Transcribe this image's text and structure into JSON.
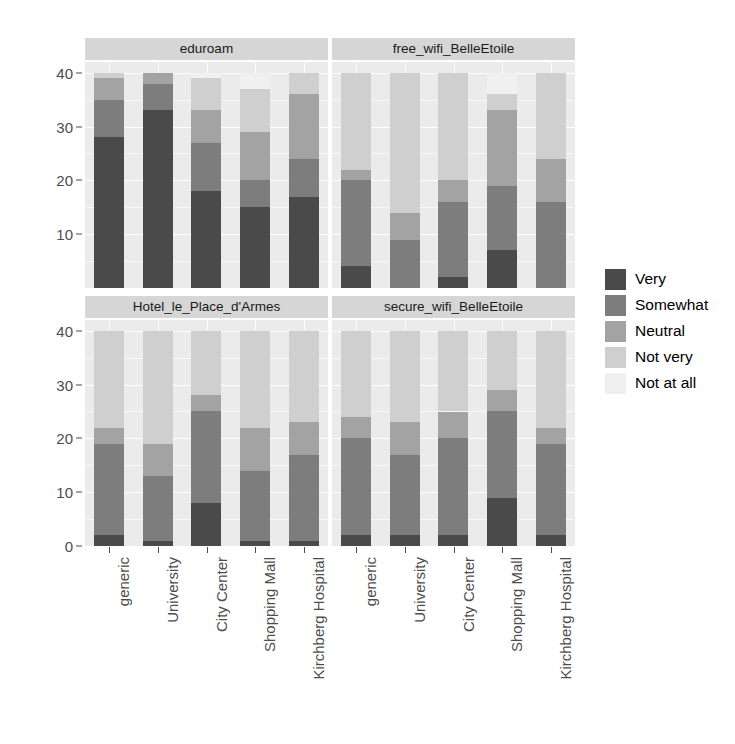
{
  "chart_data": {
    "type": "bar",
    "subtype": "stacked-bar-faceted",
    "title": "",
    "xlabel": "",
    "ylabel": "Count",
    "ylim": [
      0,
      42
    ],
    "y_ticks": [
      0,
      10,
      20,
      30,
      40
    ],
    "y_minor_ticks": [
      5,
      15,
      25,
      35
    ],
    "grid": true,
    "legend_position": "right",
    "legend_title": "",
    "categories": [
      "generic",
      "University",
      "City Center",
      "Shopping Mall",
      "Kirchberg Hospital"
    ],
    "series_order": [
      "Very",
      "Somewhat",
      "Neutral",
      "Not very",
      "Not at all"
    ],
    "series_colors": {
      "Very": "#4a4a4a",
      "Somewhat": "#7d7d7d",
      "Neutral": "#a3a3a3",
      "Not very": "#cfcfcf",
      "Not at all": "#f0f0f0"
    },
    "facets": [
      {
        "name": "eduroam",
        "position": "top-left",
        "bars": [
          {
            "category": "generic",
            "values": {
              "Very": 28,
              "Somewhat": 7,
              "Neutral": 4,
              "Not very": 1,
              "Not at all": 0
            },
            "total": 40
          },
          {
            "category": "University",
            "values": {
              "Very": 33,
              "Somewhat": 5,
              "Neutral": 2,
              "Not very": 0,
              "Not at all": 0
            },
            "total": 40
          },
          {
            "category": "City Center",
            "values": {
              "Very": 18,
              "Somewhat": 9,
              "Neutral": 6,
              "Not very": 6,
              "Not at all": 1
            },
            "total": 40
          },
          {
            "category": "Shopping Mall",
            "values": {
              "Very": 15,
              "Somewhat": 5,
              "Neutral": 9,
              "Not very": 8,
              "Not at all": 3
            },
            "total": 40
          },
          {
            "category": "Kirchberg Hospital",
            "values": {
              "Very": 17,
              "Somewhat": 7,
              "Neutral": 12,
              "Not very": 4,
              "Not at all": 0
            },
            "total": 40
          }
        ]
      },
      {
        "name": "free_wifi_BelleEtoile",
        "position": "top-right",
        "bars": [
          {
            "category": "generic",
            "values": {
              "Very": 4,
              "Somewhat": 16,
              "Neutral": 2,
              "Not very": 18,
              "Not at all": 0
            },
            "total": 40
          },
          {
            "category": "University",
            "values": {
              "Very": 0,
              "Somewhat": 9,
              "Neutral": 5,
              "Not very": 26,
              "Not at all": 0
            },
            "total": 40
          },
          {
            "category": "City Center",
            "values": {
              "Very": 2,
              "Somewhat": 14,
              "Neutral": 4,
              "Not very": 20,
              "Not at all": 0
            },
            "total": 40
          },
          {
            "category": "Shopping Mall",
            "values": {
              "Very": 7,
              "Somewhat": 12,
              "Neutral": 14,
              "Not very": 3,
              "Not at all": 4
            },
            "total": 40
          },
          {
            "category": "Kirchberg Hospital",
            "values": {
              "Very": 0,
              "Somewhat": 16,
              "Neutral": 8,
              "Not very": 16,
              "Not at all": 0
            },
            "total": 40
          }
        ]
      },
      {
        "name": "Hotel_le_Place_d'Armes",
        "position": "bottom-left",
        "bars": [
          {
            "category": "generic",
            "values": {
              "Very": 2,
              "Somewhat": 17,
              "Neutral": 3,
              "Not very": 18,
              "Not at all": 0
            },
            "total": 40
          },
          {
            "category": "University",
            "values": {
              "Very": 1,
              "Somewhat": 12,
              "Neutral": 6,
              "Not very": 21,
              "Not at all": 0
            },
            "total": 40
          },
          {
            "category": "City Center",
            "values": {
              "Very": 8,
              "Somewhat": 17,
              "Neutral": 3,
              "Not very": 12,
              "Not at all": 0
            },
            "total": 40
          },
          {
            "category": "Shopping Mall",
            "values": {
              "Very": 1,
              "Somewhat": 13,
              "Neutral": 8,
              "Not very": 18,
              "Not at all": 0
            },
            "total": 40
          },
          {
            "category": "Kirchberg Hospital",
            "values": {
              "Very": 1,
              "Somewhat": 16,
              "Neutral": 6,
              "Not very": 17,
              "Not at all": 0
            },
            "total": 40
          }
        ]
      },
      {
        "name": "secure_wifi_BelleEtoile",
        "position": "bottom-right",
        "bars": [
          {
            "category": "generic",
            "values": {
              "Very": 2,
              "Somewhat": 18,
              "Neutral": 4,
              "Not very": 16,
              "Not at all": 0
            },
            "total": 40
          },
          {
            "category": "University",
            "values": {
              "Very": 2,
              "Somewhat": 15,
              "Neutral": 6,
              "Not very": 17,
              "Not at all": 0
            },
            "total": 40
          },
          {
            "category": "City Center",
            "values": {
              "Very": 2,
              "Somewhat": 18,
              "Neutral": 5,
              "Not very": 15,
              "Not at all": 0
            },
            "total": 40
          },
          {
            "category": "Shopping Mall",
            "values": {
              "Very": 9,
              "Somewhat": 16,
              "Neutral": 4,
              "Not very": 11,
              "Not at all": 0
            },
            "total": 40
          },
          {
            "category": "Kirchberg Hospital",
            "values": {
              "Very": 2,
              "Somewhat": 17,
              "Neutral": 3,
              "Not very": 18,
              "Not at all": 0
            },
            "total": 40
          }
        ]
      }
    ]
  },
  "legend": {
    "items": [
      {
        "label": "Very",
        "color": "#4a4a4a"
      },
      {
        "label": "Somewhat",
        "color": "#7d7d7d"
      },
      {
        "label": "Neutral",
        "color": "#a3a3a3"
      },
      {
        "label": "Not very",
        "color": "#cfcfcf"
      },
      {
        "label": "Not at all",
        "color": "#f0f0f0"
      }
    ]
  },
  "axis": {
    "y_title": "Count"
  }
}
